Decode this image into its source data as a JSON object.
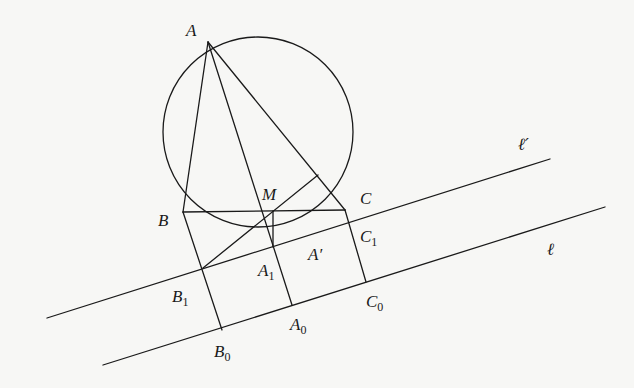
{
  "diagram": {
    "type": "geometry-construction",
    "stroke_color": "#1a1a1a",
    "background": "#f7f7f5",
    "circle": {
      "name": "circumcircle",
      "cx": 258,
      "cy": 132,
      "r": 95
    },
    "points": {
      "A": {
        "x": 208,
        "y": 42
      },
      "B": {
        "x": 183,
        "y": 212
      },
      "C": {
        "x": 345,
        "y": 210
      },
      "M": {
        "x": 273,
        "y": 211
      },
      "A1": {
        "x": 273,
        "y": 247
      },
      "B1": {
        "x": 203,
        "y": 268
      },
      "A0": {
        "x": 292,
        "y": 305
      },
      "B0": {
        "x": 222,
        "y": 330
      },
      "C0": {
        "x": 366,
        "y": 282
      },
      "P_on_AC": {
        "x": 318,
        "y": 175
      }
    },
    "lines": {
      "l_prime": {
        "x1": 47,
        "y1": 318,
        "x2": 550,
        "y2": 159
      },
      "l": {
        "x1": 103,
        "y1": 365,
        "x2": 605,
        "y2": 207
      }
    },
    "labels": {
      "A": {
        "text": "A",
        "sub": ""
      },
      "B": {
        "text": "B",
        "sub": ""
      },
      "C": {
        "text": "C",
        "sub": ""
      },
      "M": {
        "text": "M",
        "sub": ""
      },
      "A_prime": {
        "text": "A′",
        "sub": ""
      },
      "A1": {
        "text": "A",
        "sub": "1"
      },
      "B1": {
        "text": "B",
        "sub": "1"
      },
      "C1": {
        "text": "C",
        "sub": "1"
      },
      "A0": {
        "text": "A",
        "sub": "0"
      },
      "B0": {
        "text": "B",
        "sub": "0"
      },
      "C0": {
        "text": "C",
        "sub": "0"
      },
      "l_prime": {
        "text": "ℓ′"
      },
      "l": {
        "text": "ℓ"
      }
    }
  }
}
